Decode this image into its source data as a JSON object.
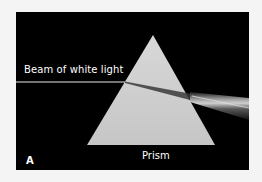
{
  "figure": {
    "panel_letter": "A",
    "labels": {
      "beam": "Beam of white light",
      "prism": "Prism"
    },
    "colors": {
      "background": "#000000",
      "prism": "#cfcfcf",
      "beam": "#e8e8e8",
      "page": "#f4f4f4"
    }
  }
}
